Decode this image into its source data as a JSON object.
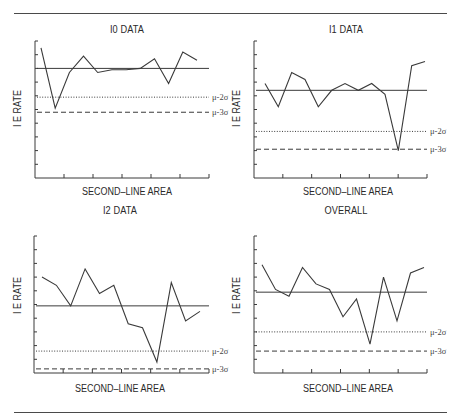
{
  "page": {
    "top_rule": {
      "x1": 14,
      "x2": 447,
      "y": 13
    },
    "bottom_rule": {
      "x1": 14,
      "x2": 447,
      "y": 412
    }
  },
  "labels": {
    "mu2": "μ-2σ",
    "mu3": "μ-3σ"
  },
  "chart_data": [
    {
      "type": "line",
      "title": "I0 DATA",
      "xlabel": "SECOND–LINE AREA",
      "ylabel": "I E RATE",
      "ylim": [
        0,
        10
      ],
      "grid": false,
      "y_ticks": 10,
      "x_ticks": 6,
      "x": [
        1,
        2,
        3,
        4,
        5,
        6,
        7,
        8,
        9,
        10,
        11,
        12
      ],
      "series": [
        {
          "name": "I0 data",
          "values": [
            9.5,
            5.1,
            7.7,
            8.9,
            7.7,
            7.9,
            7.9,
            8.0,
            8.7,
            6.9,
            9.2,
            8.6
          ]
        }
      ],
      "reference_lines": [
        {
          "name": "mean",
          "style": "solid",
          "value": 8.0
        },
        {
          "name": "μ-2σ",
          "style": "dotted",
          "value": 5.9
        },
        {
          "name": "μ-3σ",
          "style": "dashed",
          "value": 4.8
        }
      ]
    },
    {
      "type": "line",
      "title": "I1 DATA",
      "xlabel": "SECOND–LINE AREA",
      "ylabel": "I E RATE",
      "ylim": [
        0,
        10
      ],
      "grid": false,
      "y_ticks": 10,
      "x_ticks": 6,
      "x": [
        1,
        2,
        3,
        4,
        5,
        6,
        7,
        8,
        9,
        10,
        11,
        12,
        13
      ],
      "series": [
        {
          "name": "I1 data",
          "values": [
            6.9,
            5.2,
            7.7,
            7.2,
            5.2,
            6.4,
            6.9,
            6.4,
            6.9,
            6.1,
            2.0,
            8.2,
            8.5
          ]
        }
      ],
      "reference_lines": [
        {
          "name": "mean",
          "style": "solid",
          "value": 6.4
        },
        {
          "name": "μ-2σ",
          "style": "dotted",
          "value": 3.4
        },
        {
          "name": "μ-3σ",
          "style": "dashed",
          "value": 2.1
        }
      ]
    },
    {
      "type": "line",
      "title": "I2 DATA",
      "xlabel": "SECOND–LINE AREA",
      "ylabel": "I E RATE",
      "ylim": [
        0,
        10
      ],
      "grid": false,
      "y_ticks": 10,
      "x_ticks": 6,
      "x": [
        1,
        2,
        3,
        4,
        5,
        6,
        7,
        8,
        9,
        10,
        11,
        12
      ],
      "series": [
        {
          "name": "I2 data",
          "values": [
            7.0,
            6.4,
            4.9,
            7.6,
            5.8,
            6.4,
            3.6,
            3.3,
            0.8,
            6.6,
            3.8,
            4.5
          ]
        }
      ],
      "reference_lines": [
        {
          "name": "mean",
          "style": "solid",
          "value": 4.9
        },
        {
          "name": "μ-2σ",
          "style": "dotted",
          "value": 1.6
        },
        {
          "name": "μ-3σ",
          "style": "dashed",
          "value": 0.3
        }
      ]
    },
    {
      "type": "line",
      "title": "OVERALL",
      "xlabel": "SECOND–LINE AREA",
      "ylabel": "I E RATE",
      "ylim": [
        0,
        10
      ],
      "grid": false,
      "y_ticks": 10,
      "x_ticks": 6,
      "x": [
        1,
        2,
        3,
        4,
        5,
        6,
        7,
        8,
        9,
        10,
        11,
        12,
        13
      ],
      "series": [
        {
          "name": "Overall data",
          "values": [
            7.9,
            6.1,
            5.6,
            7.7,
            6.5,
            6.1,
            4.1,
            5.4,
            2.1,
            7.0,
            3.8,
            7.3,
            7.7
          ]
        }
      ],
      "reference_lines": [
        {
          "name": "mean",
          "style": "solid",
          "value": 5.9
        },
        {
          "name": "μ-2σ",
          "style": "dotted",
          "value": 3.0
        },
        {
          "name": "μ-3σ",
          "style": "dashed",
          "value": 1.6
        }
      ]
    }
  ]
}
